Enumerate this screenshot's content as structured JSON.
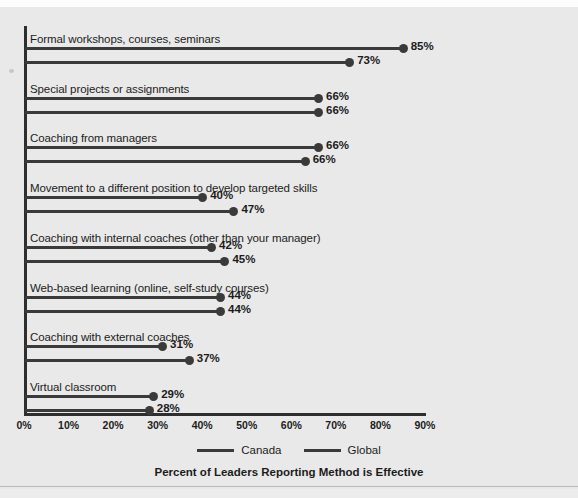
{
  "chart_data": {
    "type": "bar",
    "title": "",
    "subtitle": "",
    "xlabel": "Percent of Leaders Reporting Method is Effective",
    "ylabel": "",
    "xlim": [
      0,
      90
    ],
    "grid": false,
    "legend_position": "bottom",
    "orientation": "horizontal",
    "style": "lollipop",
    "categories": [
      "Formal workshops, courses, seminars",
      "Special projects or assignments",
      "Coaching from managers",
      "Movement to a different position to develop targeted skills",
      "Coaching with internal coaches (other than your manager)",
      "Web-based learning (online, self-study courses)",
      "Coaching with external coaches",
      "Virtual classroom"
    ],
    "series": [
      {
        "name": "Canada",
        "values": [
          85,
          66,
          66,
          40,
          42,
          44,
          31,
          29
        ],
        "labels": [
          "85%",
          "66%",
          "66%",
          "40%",
          "42%",
          "44%",
          "31%",
          "29%"
        ]
      },
      {
        "name": "Global",
        "values": [
          73,
          66,
          63,
          47,
          45,
          44,
          37,
          28
        ],
        "labels": [
          "73%",
          "66%",
          "66%",
          "47%",
          "45%",
          "44%",
          "37%",
          "28%"
        ]
      }
    ],
    "xticks": [
      0,
      10,
      20,
      30,
      40,
      50,
      60,
      70,
      80,
      90
    ],
    "xtick_labels": [
      "0%",
      "10%",
      "20%",
      "30%",
      "40%",
      "50%",
      "60%",
      "70%",
      "80%",
      "90%"
    ],
    "colors": {
      "series": "#3a3a3a",
      "axis": "#2e2e2e",
      "text": "#1c1c1c",
      "background": "#e9e9e9"
    }
  },
  "legend": {
    "items": [
      {
        "label": "Canada"
      },
      {
        "label": "Global"
      }
    ]
  },
  "axis_title": "Percent of Leaders Reporting Method is Effective"
}
